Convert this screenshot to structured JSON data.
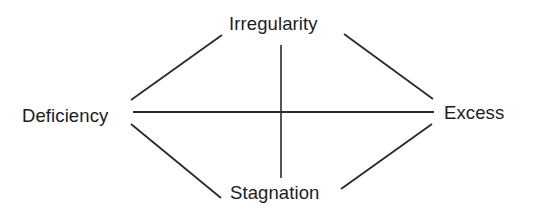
{
  "diagram": {
    "nodes": {
      "top": "Irregularity",
      "left": "Deficiency",
      "right": "Excess",
      "bottom": "Stagnation"
    },
    "edges": [
      {
        "from": "Deficiency",
        "to": "Irregularity"
      },
      {
        "from": "Irregularity",
        "to": "Excess"
      },
      {
        "from": "Deficiency",
        "to": "Stagnation"
      },
      {
        "from": "Stagnation",
        "to": "Excess"
      },
      {
        "from": "Deficiency",
        "to": "Excess"
      },
      {
        "from": "Irregularity",
        "to": "Stagnation"
      }
    ],
    "line_color": "#2a2a2a",
    "text_color": "#1c1c1c"
  }
}
